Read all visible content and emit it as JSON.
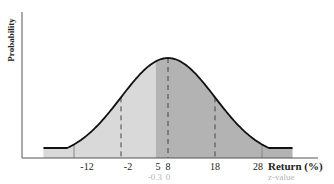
{
  "chart_data": {
    "type": "area",
    "title": "",
    "ylabel": "Probability",
    "xlabel": "Return (%)",
    "secondary_xlabel": "z-value",
    "mean": 8,
    "std_dev": 10,
    "x_ticks": [
      -12,
      -2,
      5,
      8,
      18,
      28
    ],
    "x_tick_labels": [
      "-12",
      "-2",
      "5",
      "8",
      "18",
      "28"
    ],
    "z_ticks": [
      {
        "return": 5,
        "z": -0.3,
        "label": "-0.3"
      },
      {
        "return": 8,
        "z": 0,
        "label": "0"
      }
    ],
    "dashed_lines_at": [
      -2,
      8,
      18
    ],
    "short_ticks_at": [
      -12,
      28
    ],
    "shaded_regions": [
      {
        "from": "-inf",
        "to": 5,
        "color": "#d9d9d9",
        "label": "below 5%"
      },
      {
        "from": 5,
        "to": "+inf",
        "color": "#b3b3b3",
        "label": "above 5%"
      }
    ],
    "curve_color": "#111111",
    "grid": false
  },
  "labels": {
    "ylabel": "Probability",
    "xlabel": "Return (%)",
    "zlabel": "z-value",
    "ticks": [
      "-12",
      "-2",
      "5",
      "8",
      "18",
      "28"
    ],
    "z_ticks": [
      "-0.3",
      "0"
    ]
  }
}
